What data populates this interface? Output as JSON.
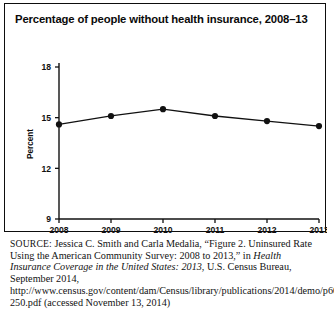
{
  "figure": {
    "title": "Percentage of people without health insurance, 2008–13",
    "source_label": "SOURCE:",
    "source_text_1": " Jessica C. Smith and Carla Medalia, “Figure 2. Uninsured Rate Using the American Community Survey: 2008 to 2013,” in ",
    "source_italic_1": "Health Insurance Coverage in the United States: 2013",
    "source_text_2": ", U.S. Census Bureau, September 2014, http://www.census.gov/content/dam/Census/library/publications/2014/demo/p60-250.pdf (accessed November 13, 2014)"
  },
  "chart_data": {
    "type": "line",
    "title": "Percentage of people without health insurance, 2008–13",
    "xlabel": "",
    "ylabel": "Percent",
    "categories": [
      "2008",
      "2009",
      "2010",
      "2011",
      "2012",
      "2013"
    ],
    "x": [
      2008,
      2009,
      2010,
      2011,
      2012,
      2013
    ],
    "values": [
      14.6,
      15.1,
      15.5,
      15.1,
      14.8,
      14.5
    ],
    "series": [
      {
        "name": "Uninsured rate",
        "values": [
          14.6,
          15.1,
          15.5,
          15.1,
          14.8,
          14.5
        ]
      }
    ],
    "ylim": [
      9,
      18
    ],
    "yticks": [
      9,
      12,
      15,
      18
    ],
    "ytick_labels": [
      "9",
      "12",
      "15",
      "18"
    ],
    "xtick_labels": [
      "2008",
      "2009",
      "2010",
      "2011",
      "2012",
      "2013"
    ],
    "grid": false,
    "legend": false,
    "legend_position": "none",
    "marker": "filled-circle",
    "line_color": "#111111",
    "marker_color": "#111111",
    "background_color": "#ffffff"
  },
  "colors": {
    "frame": "#0d0d0d",
    "text": "#111111",
    "background": "#ffffff"
  }
}
